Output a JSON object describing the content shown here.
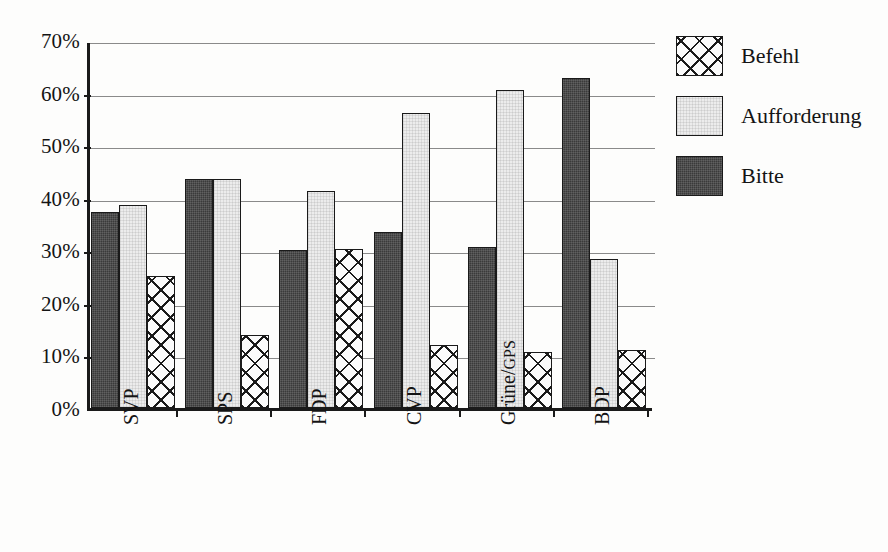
{
  "chart_data": {
    "type": "bar",
    "title": "",
    "xlabel": "",
    "ylabel": "",
    "ylim": [
      0,
      70
    ],
    "ytick_step": 10,
    "ytick_labels": [
      "0%",
      "10%",
      "20%",
      "30%",
      "40%",
      "50%",
      "60%",
      "70%"
    ],
    "grid": true,
    "legend_position": "right",
    "categories": [
      "SVP",
      "SPS",
      "FDP",
      "CVP",
      "Grüne/GPS",
      "BDP"
    ],
    "series": [
      {
        "name": "Bitte",
        "swatch": "dark-fill",
        "color": "#3a3a3a",
        "values": [
          37.2,
          43.5,
          30.0,
          33.5,
          30.6,
          62.7
        ]
      },
      {
        "name": "Aufforderung",
        "swatch": "light-fill",
        "color": "#ececec",
        "values": [
          38.6,
          43.6,
          41.3,
          56.1,
          60.5,
          28.3
        ]
      },
      {
        "name": "Befehl",
        "swatch": "cross-hatch-fill",
        "color": "#ffffff",
        "values": [
          25.2,
          13.8,
          30.2,
          12.0,
          10.7,
          11.0
        ]
      }
    ],
    "bar_order_in_group": [
      "Bitte",
      "Aufforderung",
      "Befehl"
    ]
  },
  "legend": {
    "items": [
      {
        "label": "Befehl"
      },
      {
        "label": "Aufforderung"
      },
      {
        "label": "Bitte"
      }
    ]
  },
  "axis": {
    "y_ticks": [
      "70%",
      "60%",
      "50%",
      "40%",
      "30%",
      "20%",
      "10%",
      "0%"
    ],
    "x_categories": [
      "SVP",
      "SPS",
      "FDP",
      "CVP",
      "Grüne/GPS",
      "BDP"
    ]
  }
}
